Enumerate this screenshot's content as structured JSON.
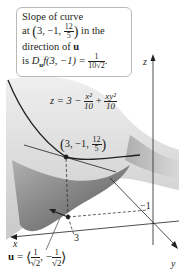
{
  "callout": {
    "line1": "Slope of curve",
    "line2_prefix": "at ",
    "point_x": "3",
    "point_y": "−1",
    "point_z_num": "12",
    "point_z_den": "5",
    "line2_suffix": " in the",
    "line3_prefix": "direction of ",
    "line3_vector": "u",
    "line4_prefix": "is ",
    "line4_D": "D",
    "line4_sub": "u",
    "line4_func": "f(3, −1) = ",
    "result_num": "1",
    "result_den": "10√2",
    "line4_end": "."
  },
  "surface_equation": {
    "lhs": "z = 3 − ",
    "term1_num": "x²",
    "term1_den": "10",
    "plus": " + ",
    "term2_num": "xy²",
    "term2_den": "10"
  },
  "point_label": {
    "x": "3",
    "y": "−1",
    "z_num": "12",
    "z_den": "5"
  },
  "axes": {
    "x_label": "x",
    "y_label": "y",
    "z_label": "z",
    "tick_x": "3",
    "tick_y": "−1"
  },
  "direction_vector": {
    "name": "u",
    "equals": " = ",
    "c1_num": "1",
    "c1_den": "√2",
    "c2_sign": "−",
    "c2_num": "1",
    "c2_den": "√2"
  },
  "colors": {
    "surface_light": "#e6e6e6",
    "surface_mid": "#bdbdbd",
    "surface_dark": "#5a5a5a",
    "curve": "#231f20",
    "callout_border": "#b9b9b9"
  }
}
